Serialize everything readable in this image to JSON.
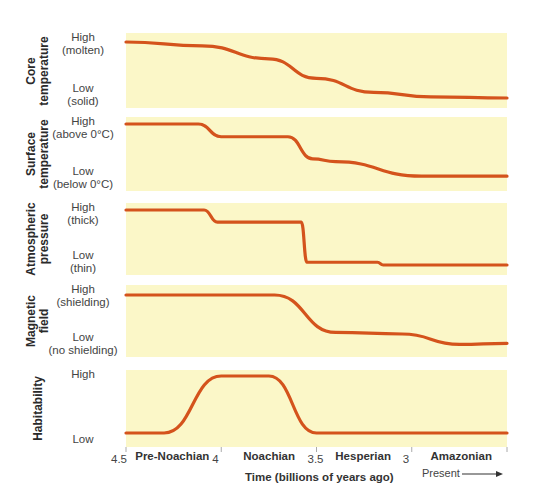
{
  "chart_data": {
    "type": "line",
    "title": "",
    "xlabel": "Time (billions of years ago)",
    "x_ticks": [
      "4.5",
      "4",
      "3.5",
      "3"
    ],
    "xlim": [
      4.5,
      2.5
    ],
    "eras": [
      "Pre-Noachian",
      "Noachian",
      "Hesperian",
      "Amazonian"
    ],
    "present_label": "Present",
    "panels": [
      {
        "name": "Core temperature",
        "title_lines": [
          "Core",
          "temperature"
        ],
        "high": [
          "High",
          "(molten)"
        ],
        "low": [
          "Low",
          "(solid)"
        ],
        "x": [
          4.5,
          4.1,
          3.75,
          3.5,
          3.2,
          2.9,
          2.5
        ],
        "y": [
          1.0,
          0.93,
          0.7,
          0.35,
          0.1,
          0.02,
          0.0
        ]
      },
      {
        "name": "Surface temperature",
        "title_lines": [
          "Surface",
          "temperature"
        ],
        "high": [
          "High",
          "(above 0°C)"
        ],
        "low": [
          "Low",
          "(below 0°C)"
        ],
        "x": [
          4.5,
          4.12,
          4.0,
          3.65,
          3.52,
          3.4,
          2.95,
          2.5
        ],
        "y": [
          1.0,
          1.0,
          0.78,
          0.78,
          0.4,
          0.35,
          0.1,
          0.1
        ]
      },
      {
        "name": "Atmospheric pressure",
        "title_lines": [
          "Atmospheric",
          "pressure"
        ],
        "high": [
          "High",
          "(thick)"
        ],
        "low": [
          "Low",
          "(thin)"
        ],
        "x": [
          4.5,
          4.09,
          4.02,
          3.58,
          3.55,
          3.18,
          3.15,
          2.5
        ],
        "y": [
          1.0,
          1.0,
          0.78,
          0.78,
          0.05,
          0.05,
          0.0,
          0.0
        ]
      },
      {
        "name": "Magnetic field",
        "title_lines": [
          "Magnetic",
          "field"
        ],
        "high": [
          "High",
          "(shielding)"
        ],
        "low": [
          "Low",
          "(no shielding)"
        ],
        "x": [
          4.5,
          3.72,
          3.4,
          3.05,
          2.75,
          2.5
        ],
        "y": [
          1.0,
          1.0,
          0.28,
          0.25,
          0.05,
          0.07
        ]
      },
      {
        "name": "Habitability",
        "title_lines": [
          "Habitability"
        ],
        "high": [
          "High"
        ],
        "low": [
          "Low"
        ],
        "x": [
          4.5,
          4.3,
          4.0,
          3.75,
          3.5,
          2.5
        ],
        "y": [
          0.0,
          0.0,
          1.0,
          1.0,
          0.0,
          0.0
        ]
      }
    ]
  }
}
